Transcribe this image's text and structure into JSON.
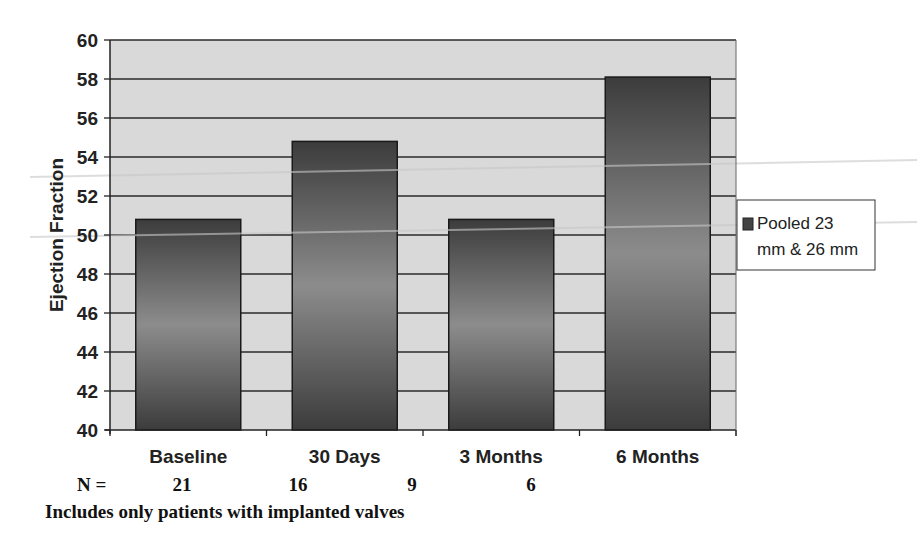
{
  "chart_data": {
    "type": "bar",
    "title": "",
    "xlabel": "",
    "ylabel": "Ejection Fraction",
    "ylim": [
      40,
      60
    ],
    "yticks": [
      40,
      42,
      44,
      46,
      48,
      50,
      52,
      54,
      56,
      58,
      60
    ],
    "grid": true,
    "legend_position": "right",
    "categories": [
      "Baseline",
      "30 Days",
      "3 Months",
      "6 Months"
    ],
    "series": [
      {
        "name": "Pooled 23 mm & 26 mm",
        "values": [
          50.8,
          54.8,
          50.8,
          58.1
        ]
      }
    ],
    "n_label": "N =",
    "n_values": [
      "21",
      "16",
      "9",
      "6"
    ],
    "footnote": "Includes only patients with implanted valves"
  },
  "legend": {
    "line1": "Pooled 23",
    "line2": "mm & 26 mm"
  },
  "colors": {
    "plot_bg": "#d9d9d9",
    "bar_dark": "#3a3a3a",
    "bar_light": "#8a8a8a",
    "grid": "#333333"
  }
}
